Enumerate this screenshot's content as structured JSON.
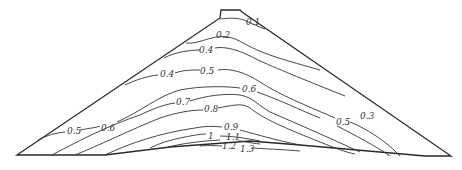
{
  "diagram": {
    "title": "",
    "type": "contour section (embankment / dam cross-section)",
    "contour_labels": [
      {
        "text": "0.1",
        "x": 246,
        "y": 25
      },
      {
        "text": "0.2",
        "x": 216,
        "y": 38
      },
      {
        "text": "0.4",
        "x": 199,
        "y": 53
      },
      {
        "text": "0.4",
        "x": 162,
        "y": 75
      },
      {
        "text": "0.5",
        "x": 201,
        "y": 74
      },
      {
        "text": "0.6",
        "x": 245,
        "y": 88
      },
      {
        "text": "0.7",
        "x": 178,
        "y": 103
      },
      {
        "text": "0.8",
        "x": 205,
        "y": 110
      },
      {
        "text": "0.9",
        "x": 225,
        "y": 128
      },
      {
        "text": "1",
        "x": 209,
        "y": 137
      },
      {
        "text": "1.1",
        "x": 229,
        "y": 137
      },
      {
        "text": "1.2",
        "x": 223,
        "y": 147
      },
      {
        "text": "1.3",
        "x": 241,
        "y": 150
      },
      {
        "text": "0.5",
        "x": 70,
        "y": 133
      },
      {
        "text": "0.6",
        "x": 103,
        "y": 131
      },
      {
        "text": "0.5",
        "x": 335,
        "y": 125
      },
      {
        "text": "0.3",
        "x": 360,
        "y": 120
      }
    ]
  }
}
